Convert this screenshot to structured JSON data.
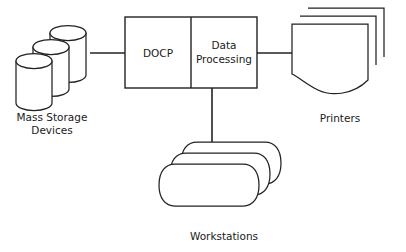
{
  "diagram": {
    "type": "block-diagram",
    "background_color": "#ffffff",
    "stroke_color": "#222222",
    "nodes": {
      "mass_storage": {
        "caption_line1": "Mass Storage",
        "caption_line2": "Devices",
        "shape": "stacked-cylinders",
        "count": 3
      },
      "central_unit": {
        "shape": "split-rectangle",
        "left_label": "DOCP",
        "right_label_line1": "Data",
        "right_label_line2": "Processing"
      },
      "printers": {
        "caption": "Printers",
        "shape": "stacked-documents",
        "count": 3
      },
      "workstations": {
        "caption": "Workstations",
        "shape": "stacked-rounded-rects",
        "count": 3
      }
    },
    "connections": [
      {
        "name": "storage-to-docp",
        "from": "mass_storage",
        "to": "central_unit",
        "orientation": "horizontal"
      },
      {
        "name": "dataprocessing-to-printers",
        "from": "central_unit",
        "to": "printers",
        "orientation": "horizontal"
      },
      {
        "name": "dataprocessing-to-workstations",
        "from": "central_unit",
        "to": "workstations",
        "orientation": "vertical"
      }
    ]
  }
}
